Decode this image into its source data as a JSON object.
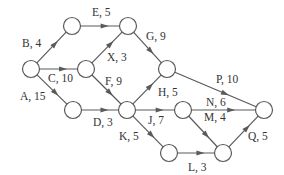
{
  "diagram": {
    "type": "activity-on-arrow network",
    "node_radius": 8.5,
    "colors": {
      "stroke": "#5a5a5a",
      "text": "#333333",
      "background": "#ffffff"
    },
    "nodes": [
      {
        "id": "n1",
        "x": 31,
        "y": 69
      },
      {
        "id": "n2",
        "x": 72,
        "y": 26
      },
      {
        "id": "n3",
        "x": 86,
        "y": 69
      },
      {
        "id": "n4",
        "x": 73,
        "y": 110
      },
      {
        "id": "n5",
        "x": 128,
        "y": 26
      },
      {
        "id": "n6",
        "x": 167,
        "y": 69
      },
      {
        "id": "n7",
        "x": 127,
        "y": 110
      },
      {
        "id": "n8",
        "x": 183,
        "y": 110
      },
      {
        "id": "n9",
        "x": 169,
        "y": 153
      },
      {
        "id": "n10",
        "x": 223,
        "y": 153
      },
      {
        "id": "n11",
        "x": 264,
        "y": 110
      }
    ],
    "edges": [
      {
        "from": "n1",
        "to": "n2",
        "label": "B, 4",
        "lx": 22,
        "ly": 47
      },
      {
        "from": "n1",
        "to": "n3",
        "label": "C, 10",
        "lx": 48,
        "ly": 82
      },
      {
        "from": "n1",
        "to": "n4",
        "label": "A, 15",
        "lx": 20,
        "ly": 100
      },
      {
        "from": "n2",
        "to": "n5",
        "label": "E, 5",
        "lx": 92,
        "ly": 16
      },
      {
        "from": "n3",
        "to": "n5",
        "label": "X, 3",
        "lx": 107,
        "ly": 61
      },
      {
        "from": "n3",
        "to": "n7",
        "label": "F, 9",
        "lx": 105,
        "ly": 85
      },
      {
        "from": "n5",
        "to": "n6",
        "label": "G, 9",
        "lx": 146,
        "ly": 40
      },
      {
        "from": "n4",
        "to": "n7",
        "label": "D, 3",
        "lx": 93,
        "ly": 126
      },
      {
        "from": "n7",
        "to": "n6",
        "label": "H, 5",
        "lx": 158,
        "ly": 96
      },
      {
        "from": "n6",
        "to": "n11",
        "label": "P, 10",
        "lx": 216,
        "ly": 83
      },
      {
        "from": "n7",
        "to": "n8",
        "label": "J, 7",
        "lx": 148,
        "ly": 124
      },
      {
        "from": "n7",
        "to": "n9",
        "label": "K, 5",
        "lx": 119,
        "ly": 140
      },
      {
        "from": "n8",
        "to": "n11",
        "label": "N, 6",
        "lx": 206,
        "ly": 106
      },
      {
        "from": "n8",
        "to": "n10",
        "label": "M, 4",
        "lx": 204,
        "ly": 121
      },
      {
        "from": "n9",
        "to": "n10",
        "label": "L, 3",
        "lx": 188,
        "ly": 171
      },
      {
        "from": "n10",
        "to": "n11",
        "label": "Q, 5",
        "lx": 248,
        "ly": 140
      }
    ]
  }
}
